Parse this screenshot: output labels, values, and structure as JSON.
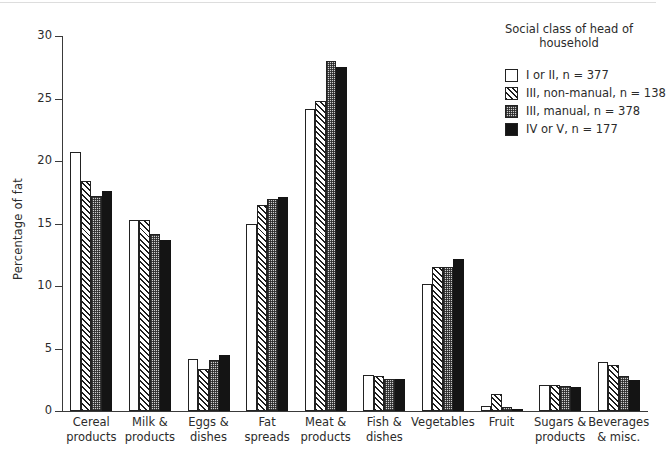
{
  "chart_data": {
    "type": "bar",
    "title": "",
    "xlabel": "",
    "ylabel": "Percentage of fat",
    "ylim": [
      0,
      30
    ],
    "yticks": [
      0,
      5,
      10,
      15,
      20,
      25,
      30
    ],
    "ytick_labels": [
      "0",
      "5",
      "10",
      "15",
      "20",
      "25",
      "30"
    ],
    "grid": false,
    "legend_position": "top-right",
    "legend_title": "Social class of head of\nhousehold",
    "categories": [
      "Cereal\nproducts",
      "Milk &\nproducts",
      "Eggs &\ndishes",
      "Fat\nspreads",
      "Meat &\nproducts",
      "Fish &\ndishes",
      "Vegetables",
      "Fruit",
      "Sugars &\nproducts",
      "Beverages\n& misc."
    ],
    "series": [
      {
        "name": "I or II,   n = 377",
        "fill": "white",
        "values": [
          20.7,
          15.3,
          4.2,
          15.0,
          24.2,
          2.9,
          10.2,
          0.4,
          2.1,
          3.9
        ]
      },
      {
        "name": "III, non-manual,  n = 138",
        "fill": "diagonal-hatch",
        "values": [
          18.4,
          15.3,
          3.4,
          16.5,
          24.8,
          2.8,
          11.5,
          1.4,
          2.1,
          3.7
        ]
      },
      {
        "name": "III,  manual,  n = 378",
        "fill": "stipple",
        "values": [
          17.2,
          14.2,
          4.1,
          17.0,
          28.0,
          2.6,
          11.5,
          0.3,
          2.0,
          2.8
        ]
      },
      {
        "name": "IV or V,   n = 177",
        "fill": "black",
        "values": [
          17.6,
          13.7,
          4.5,
          17.1,
          27.5,
          2.6,
          12.2,
          0.2,
          1.9,
          2.5
        ]
      }
    ]
  },
  "legend": {
    "title_line1": "Social class of head of",
    "title_line2": "household",
    "entries": [
      {
        "swatch": "white",
        "label": "I or II,   n = 377"
      },
      {
        "swatch": "diagonal-hatch",
        "label": "III, non-manual,  n = 138"
      },
      {
        "swatch": "stipple",
        "label": "III,  manual,  n = 378"
      },
      {
        "swatch": "black",
        "label": "IV or V,   n = 177"
      }
    ]
  },
  "axes": {
    "y_title": "Percentage of fat"
  },
  "colors": {
    "ink": "#2b2b2b",
    "axis": "#3a3a3a",
    "bar_outline": "#222222",
    "black_fill": "#141414",
    "stipple_fill": "#cfcfcf",
    "white_fill": "#ffffff"
  }
}
